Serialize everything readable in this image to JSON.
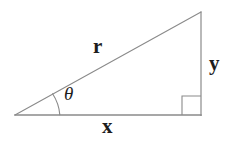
{
  "figure": {
    "name": "right-triangle-polar-coordinates",
    "background_color": "#ffffff",
    "line_color": "#8a8a8a",
    "label_color": "#1d1d1d",
    "line_width": 1.1
  },
  "geometry": {
    "vertices": {
      "origin": {
        "x": 15,
        "y": 115
      },
      "apex": {
        "x": 201,
        "y": 12
      },
      "right_angle": {
        "x": 201,
        "y": 115
      }
    },
    "edges": [
      {
        "id": "hypotenuse",
        "from": "origin",
        "to": "apex",
        "label_key": "hypotenuse"
      },
      {
        "id": "vertical-leg",
        "from": "apex",
        "to": "right_angle",
        "label_key": "vertical_leg"
      },
      {
        "id": "base-leg",
        "from": "right_angle",
        "to": "origin",
        "label_key": "base_leg"
      }
    ],
    "right_angle_marker": {
      "x": 182,
      "y": 96,
      "size": 19
    },
    "angle_arc": {
      "center_x": 15,
      "center_y": 115,
      "radius": 45,
      "start_x": 58,
      "start_y": 113,
      "end_x": 53,
      "end_y": 94
    }
  },
  "labels": {
    "hypotenuse": "r",
    "vertical_leg": "y",
    "base_leg": "x",
    "angle": "θ"
  }
}
